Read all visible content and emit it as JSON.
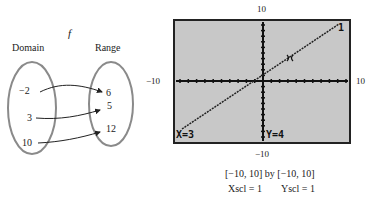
{
  "mapping": {
    "function_name": "f",
    "domain_label": "Domain",
    "range_label": "Range",
    "domain_values": [
      "−2",
      "3",
      "10"
    ],
    "range_values": [
      "6",
      "5",
      "12"
    ],
    "arrows": [
      {
        "from": "−2",
        "to": "6"
      },
      {
        "from": "3",
        "to": "5"
      },
      {
        "from": "10",
        "to": "12"
      }
    ]
  },
  "calculator": {
    "screen_bg": "#c8c8c8",
    "window_labels": {
      "top": "10",
      "bottom": "−10",
      "left": "−10",
      "right": "10"
    },
    "graph_number": "1",
    "trace_x": "X=3",
    "trace_y": "Y=4",
    "caption_line1": "[−10, 10] by [−10, 10]",
    "xscl": "Xscl = 1",
    "yscl": "Yscl = 1"
  }
}
